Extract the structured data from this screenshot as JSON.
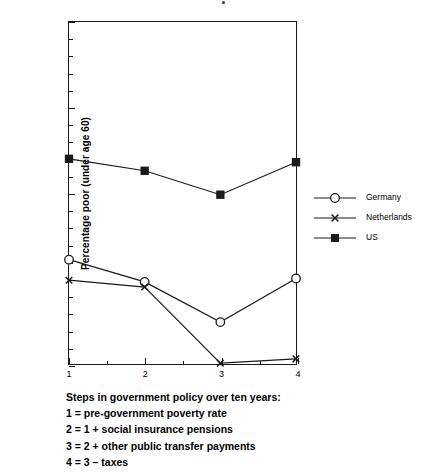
{
  "chart_data": {
    "type": "line",
    "title": "",
    "xlabel": "",
    "ylabel": "Percentage poor (under age 60)",
    "x": [
      1,
      2,
      3,
      4
    ],
    "categories": [
      "1",
      "2",
      "3",
      "4"
    ],
    "xlim": [
      1,
      4
    ],
    "ylim": [
      0,
      20
    ],
    "y_ticks": [
      0,
      5,
      10,
      15,
      20
    ],
    "y_tick_labels": [
      "0",
      "5",
      "10",
      "15",
      "20"
    ],
    "x_ticks": [
      1,
      2,
      3,
      4
    ],
    "x_tick_labels": [
      "1",
      "2",
      "3",
      "4"
    ],
    "grid": false,
    "legend_position": "right",
    "series": [
      {
        "name": "Germany",
        "marker": "open-circle",
        "values": [
          6.1,
          4.8,
          2.45,
          5.0
        ]
      },
      {
        "name": "Netherlands",
        "marker": "x-cross",
        "values": [
          4.9,
          4.5,
          0.05,
          0.3
        ]
      },
      {
        "name": "US",
        "marker": "filled-square",
        "values": [
          12.0,
          11.3,
          9.9,
          11.8
        ]
      }
    ],
    "annotations": [
      "Steps in government policy over ten years:",
      "1 = pre-government poverty rate",
      "2 = 1 + social insurance pensions",
      "3 = 2 + other public transfer payments",
      "4 = 3 – taxes"
    ]
  },
  "axis": {
    "y_title": "Percentage poor (under age 60)",
    "y_tick_labels": [
      "20",
      "15",
      "10",
      "5",
      "0"
    ],
    "x_tick_labels": [
      "1",
      "2",
      "3",
      "4"
    ]
  },
  "legend": {
    "items": [
      {
        "label": "Germany",
        "marker": "open-circle"
      },
      {
        "label": "Netherlands",
        "marker": "x-cross"
      },
      {
        "label": "US",
        "marker": "filled-square"
      }
    ]
  },
  "caption": {
    "line1": "Steps in government policy over ten years:",
    "line2": "1 = pre-government poverty rate",
    "line3": "2 = 1 + social insurance pensions",
    "line4": "3 = 2 + other public transfer payments",
    "line5": "4 = 3 – taxes"
  },
  "colors": {
    "ink": "#1a1a1a",
    "background": "#ffffff"
  }
}
